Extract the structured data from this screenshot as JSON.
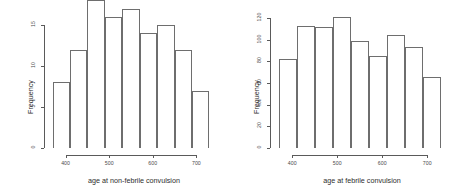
{
  "chart_data": [
    {
      "type": "bar",
      "title": "",
      "xlabel": "age at non-febrile convulsion",
      "ylabel": "Frequency",
      "categories": [
        "370-410",
        "410-450",
        "450-490",
        "490-530",
        "530-570",
        "570-610",
        "610-650",
        "650-690",
        "690-730"
      ],
      "bin_edges": [
        370,
        410,
        450,
        490,
        530,
        570,
        610,
        650,
        690,
        730
      ],
      "values": [
        8,
        12,
        18,
        16,
        17,
        14,
        15,
        12,
        7
      ],
      "xlim": [
        355,
        745
      ],
      "ylim": [
        0,
        18
      ],
      "xticks": [
        400,
        500,
        600,
        700
      ],
      "xtick_labels": [
        "400",
        "500",
        "600",
        "700"
      ],
      "yticks": [
        0,
        5,
        10,
        15
      ],
      "ytick_labels": [
        "0",
        "5",
        "10",
        "15"
      ],
      "grid": false,
      "legend": false,
      "bar_edge_color": "#6e6e6e",
      "bar_fill_color": "transparent"
    },
    {
      "type": "bar",
      "title": "",
      "xlabel": "age at febrile convulsion",
      "ylabel": "Frequency",
      "categories": [
        "370-410",
        "410-450",
        "450-490",
        "490-530",
        "530-570",
        "570-610",
        "610-650",
        "650-690",
        "690-730"
      ],
      "bin_edges": [
        370,
        410,
        450,
        490,
        530,
        570,
        610,
        650,
        690,
        730
      ],
      "values": [
        82,
        113,
        112,
        121,
        99,
        85,
        104,
        93,
        66
      ],
      "xlim": [
        355,
        755
      ],
      "ylim": [
        0,
        122
      ],
      "xticks": [
        400,
        500,
        600,
        700
      ],
      "xtick_labels": [
        "400",
        "500",
        "600",
        "700"
      ],
      "yticks": [
        0,
        20,
        40,
        60,
        80,
        100,
        120
      ],
      "ytick_labels": [
        "0",
        "20",
        "40",
        "60",
        "80",
        "100",
        "120"
      ],
      "grid": false,
      "legend": false,
      "bar_edge_color": "#6e6e6e",
      "bar_fill_color": "transparent"
    }
  ],
  "panels": [
    {
      "name": "non-febrile-histogram"
    },
    {
      "name": "febrile-histogram"
    }
  ]
}
